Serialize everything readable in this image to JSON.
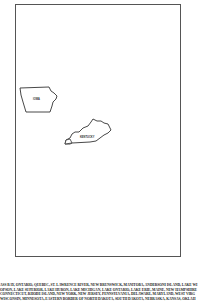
{
  "map": {
    "states": [
      {
        "name": "iowa",
        "label": "IOWA"
      },
      {
        "name": "kentucky",
        "label": "KENTUCKY"
      }
    ],
    "outline_color": "#333333",
    "frame_color": "#555555"
  },
  "caption": {
    "lines": [
      "ASS BAY, ONTARIO, QUEBEC, ST. LAWRENCE RIVER, NEW BRUNSWICK, MANITOBA, ANDERSONI ISLAND, LAKE WI",
      "OPSON, LAKE SUPERIOR, LAKE HURON, LAKE MICHIGAN, LAKE ONTARIO, LAKE ERIE, MAINE, NEW HAMPSHIRE",
      "CONNECTICUT, RHODE ISLAND, NEW YORK, NEW JERSEY, PENNSYLVANIA, DELAWARE, MARYLAND, WEST VIRG",
      "WISCONSIN, MINNESOTA, EASTERN BORDER OF NORTH DAKOTA, SOUTH DAKOTA, NEBRASKA, KANSAS, OKLAH"
    ]
  }
}
